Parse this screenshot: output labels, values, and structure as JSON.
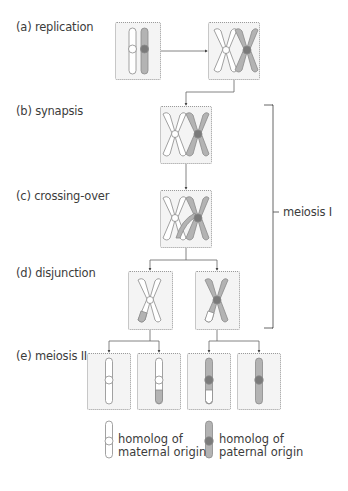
{
  "stages": [
    {
      "id": "a",
      "label": "(a) replication"
    },
    {
      "id": "b",
      "label": "(b) synapsis"
    },
    {
      "id": "c",
      "label": "(c) crossing-over"
    },
    {
      "id": "d",
      "label": "(d) disjunction"
    },
    {
      "id": "e",
      "label": "(e) meiosis II"
    }
  ],
  "bracket": {
    "label": "meiosis I"
  },
  "legend": [
    {
      "id": "maternal",
      "line1": "homolog of",
      "line2": "maternal origin",
      "color": "#ffffff"
    },
    {
      "id": "paternal",
      "line1": "homolog of",
      "line2": "paternal origin",
      "color": "#b5b5b5"
    }
  ],
  "colors": {
    "maternal_fill": "#ffffff",
    "paternal_fill": "#b3b3b3",
    "outline": "#8a8a8a",
    "centromere_paternal": "#7a7a7a",
    "box_bg": "#f4f4f4",
    "connector": "#666666"
  }
}
